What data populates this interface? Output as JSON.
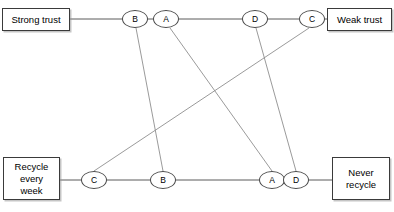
{
  "diagram": {
    "type": "slope-ladder-diagram",
    "width": 394,
    "height": 212,
    "background_color": "#ffffff",
    "axis_color": "#5b5b5b",
    "connector_color": "#8f8f8f",
    "node_border_color": "#4a4a4a",
    "box_border_color": "#3a3a3a",
    "text_color": "#000000"
  },
  "boxes": {
    "top_left": {
      "label": "Strong trust",
      "x": 2,
      "y": 8,
      "w": 68,
      "h": 23
    },
    "top_right": {
      "label": "Weak trust",
      "x": 327,
      "y": 8,
      "w": 65,
      "h": 23
    },
    "bottom_left": {
      "label": "Recycle\never y\nweek",
      "display": "Recycle\nevery\nweek",
      "x": 3,
      "y": 157,
      "w": 57,
      "h": 43
    },
    "bottom_right": {
      "label": "Never\nrecycle",
      "x": 332,
      "y": 157,
      "w": 58,
      "h": 43
    }
  },
  "axes": [
    {
      "name": "top-axis",
      "y": 19,
      "x1": 69,
      "x2": 328
    },
    {
      "name": "bottom-axis",
      "y": 180,
      "x1": 60,
      "x2": 333
    }
  ],
  "nodes": {
    "top": [
      {
        "id": "top-B",
        "label": "B",
        "cx": 135,
        "cy": 19,
        "rx": 13,
        "ry": 9
      },
      {
        "id": "top-A",
        "label": "A",
        "cx": 166,
        "cy": 19,
        "rx": 13,
        "ry": 9
      },
      {
        "id": "top-D",
        "label": "D",
        "cx": 255,
        "cy": 19,
        "rx": 13,
        "ry": 9
      },
      {
        "id": "top-C",
        "label": "C",
        "cx": 312,
        "cy": 19,
        "rx": 13,
        "ry": 9
      }
    ],
    "bottom": [
      {
        "id": "bottom-C",
        "label": "C",
        "cx": 94,
        "cy": 180,
        "rx": 13,
        "ry": 9
      },
      {
        "id": "bottom-B",
        "label": "B",
        "cx": 163,
        "cy": 180,
        "rx": 13,
        "ry": 9
      },
      {
        "id": "bottom-A",
        "label": "A",
        "cx": 272,
        "cy": 180,
        "rx": 13,
        "ry": 9
      },
      {
        "id": "bottom-D",
        "label": "D",
        "cx": 296,
        "cy": 180,
        "rx": 13,
        "ry": 9
      }
    ]
  },
  "connections": [
    {
      "name": "connector-B",
      "from": "top-B",
      "to": "bottom-B",
      "x1": 136,
      "y1": 28,
      "x2": 163,
      "y2": 171
    },
    {
      "name": "connector-A",
      "from": "top-A",
      "to": "bottom-A",
      "x1": 170,
      "y1": 28,
      "x2": 272,
      "y2": 171
    },
    {
      "name": "connector-D",
      "from": "top-D",
      "to": "bottom-D",
      "x1": 256,
      "y1": 28,
      "x2": 296,
      "y2": 171
    },
    {
      "name": "connector-C",
      "from": "top-C",
      "to": "bottom-C",
      "x1": 309,
      "y1": 28,
      "x2": 94,
      "y2": 171
    }
  ]
}
